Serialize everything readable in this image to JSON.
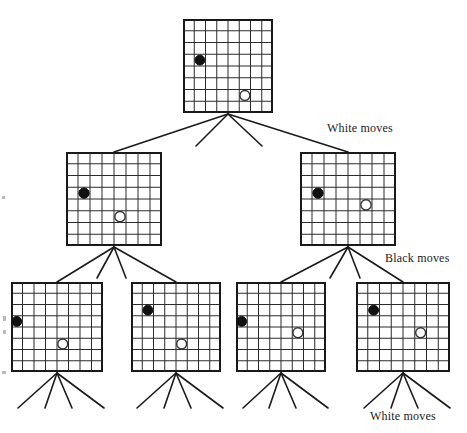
{
  "figure": {
    "type": "game-tree",
    "title": ""
  },
  "labels": [
    {
      "name": "white-moves-level-1",
      "text": "White moves",
      "x": 327,
      "y": 121
    },
    {
      "name": "black-moves-level-2",
      "text": "Black moves",
      "x": 385,
      "y": 251
    },
    {
      "name": "white-moves-level-3",
      "text": "White moves",
      "x": 370,
      "y": 409
    }
  ],
  "board_spec": {
    "cols": 8,
    "rows": 8,
    "grid_color": "#2b2b2b",
    "border_color": "#1a1a1a",
    "grid_line_width": 1,
    "border_line_width": 2,
    "black_stone_color": "#111111",
    "white_stone_fill": "#ffffff",
    "white_stone_stroke": "#333333"
  },
  "levels": [
    {
      "index": 0,
      "name": "root-level",
      "nodes": [
        {
          "id": "root",
          "name": "board-root",
          "x": 183,
          "y": 19,
          "w": 90,
          "h": 94,
          "stones": [
            {
              "color": "black",
              "col": 1,
              "row": 3
            },
            {
              "color": "white",
              "col": 5,
              "row": 6
            }
          ]
        }
      ]
    },
    {
      "index": 1,
      "name": "level-2",
      "nodes": [
        {
          "id": "n-l",
          "name": "board-level2-left",
          "x": 66,
          "y": 152,
          "w": 96,
          "h": 94,
          "stones": [
            {
              "color": "black",
              "col": 1,
              "row": 3
            },
            {
              "color": "white",
              "col": 4,
              "row": 5
            }
          ]
        },
        {
          "id": "n-r",
          "name": "board-level2-right",
          "x": 300,
          "y": 152,
          "w": 96,
          "h": 94,
          "stones": [
            {
              "color": "black",
              "col": 1,
              "row": 3
            },
            {
              "color": "white",
              "col": 5,
              "row": 4
            }
          ]
        }
      ]
    },
    {
      "index": 2,
      "name": "level-3",
      "nodes": [
        {
          "id": "n-ll",
          "name": "board-level3-1",
          "x": 11,
          "y": 282,
          "w": 92,
          "h": 90,
          "stones": [
            {
              "color": "black",
              "col": 0,
              "row": 3
            },
            {
              "color": "white",
              "col": 4,
              "row": 5
            }
          ]
        },
        {
          "id": "n-lr",
          "name": "board-level3-2",
          "x": 131,
          "y": 282,
          "w": 90,
          "h": 90,
          "stones": [
            {
              "color": "black",
              "col": 1,
              "row": 2
            },
            {
              "color": "white",
              "col": 4,
              "row": 5
            }
          ]
        },
        {
          "id": "n-rl",
          "name": "board-level3-3",
          "x": 236,
          "y": 282,
          "w": 90,
          "h": 90,
          "stones": [
            {
              "color": "black",
              "col": 0,
              "row": 3
            },
            {
              "color": "white",
              "col": 5,
              "row": 4
            }
          ]
        },
        {
          "id": "n-rr",
          "name": "board-level3-4",
          "x": 356,
          "y": 282,
          "w": 94,
          "h": 90,
          "stones": [
            {
              "color": "black",
              "col": 1,
              "row": 2
            },
            {
              "color": "white",
              "col": 5,
              "row": 4
            }
          ]
        }
      ]
    }
  ],
  "edges": {
    "line_color": "#1a1a1a",
    "line_width": 1.6,
    "fans": [
      {
        "name": "fan-root",
        "from": {
          "x": 228,
          "y": 114
        },
        "to": [
          {
            "x": 114,
            "y": 152,
            "terminal": true
          },
          {
            "x": 196,
            "y": 152,
            "terminal": false,
            "stub_to": {
              "x": 196,
              "y": 146
            }
          },
          {
            "x": 262,
            "y": 152,
            "terminal": false,
            "stub_to": {
              "x": 262,
              "y": 146
            }
          },
          {
            "x": 348,
            "y": 152,
            "terminal": true
          }
        ]
      },
      {
        "name": "fan-level2-left",
        "from": {
          "x": 114,
          "y": 247
        },
        "to": [
          {
            "x": 57,
            "y": 282,
            "terminal": true
          },
          {
            "x": 97,
            "y": 278,
            "terminal": false
          },
          {
            "x": 126,
            "y": 278,
            "terminal": false
          },
          {
            "x": 176,
            "y": 282,
            "terminal": true
          }
        ]
      },
      {
        "name": "fan-level2-right",
        "from": {
          "x": 348,
          "y": 247
        },
        "to": [
          {
            "x": 281,
            "y": 282,
            "terminal": true
          },
          {
            "x": 330,
            "y": 278,
            "terminal": false
          },
          {
            "x": 360,
            "y": 278,
            "terminal": false
          },
          {
            "x": 403,
            "y": 282,
            "terminal": true
          }
        ]
      },
      {
        "name": "fan-level3-1",
        "from": {
          "x": 57,
          "y": 373
        },
        "to": [
          {
            "x": 18,
            "y": 408,
            "terminal": false
          },
          {
            "x": 45,
            "y": 408,
            "terminal": false
          },
          {
            "x": 72,
            "y": 408,
            "terminal": false
          },
          {
            "x": 104,
            "y": 408,
            "terminal": false
          }
        ]
      },
      {
        "name": "fan-level3-2",
        "from": {
          "x": 176,
          "y": 373
        },
        "to": [
          {
            "x": 137,
            "y": 408,
            "terminal": false
          },
          {
            "x": 164,
            "y": 408,
            "terminal": false
          },
          {
            "x": 191,
            "y": 408,
            "terminal": false
          },
          {
            "x": 223,
            "y": 408,
            "terminal": false
          }
        ]
      },
      {
        "name": "fan-level3-3",
        "from": {
          "x": 281,
          "y": 373
        },
        "to": [
          {
            "x": 243,
            "y": 408,
            "terminal": false
          },
          {
            "x": 269,
            "y": 408,
            "terminal": false
          },
          {
            "x": 296,
            "y": 408,
            "terminal": false
          },
          {
            "x": 328,
            "y": 408,
            "terminal": false
          }
        ]
      },
      {
        "name": "fan-level3-4",
        "from": {
          "x": 403,
          "y": 373
        },
        "to": [
          {
            "x": 364,
            "y": 408,
            "terminal": false
          },
          {
            "x": 391,
            "y": 408,
            "terminal": false
          },
          {
            "x": 418,
            "y": 408,
            "terminal": false
          },
          {
            "x": 450,
            "y": 408,
            "terminal": false
          }
        ]
      }
    ]
  },
  "scan_artifacts": [
    {
      "name": "scan-speck-1",
      "x": 3,
      "y": 316,
      "w": 3,
      "h": 5
    },
    {
      "name": "scan-speck-2",
      "x": 3,
      "y": 330,
      "w": 3,
      "h": 4
    },
    {
      "name": "scan-speck-3",
      "x": 2,
      "y": 371,
      "w": 4,
      "h": 3
    },
    {
      "name": "scan-speck-4",
      "x": 2,
      "y": 196,
      "w": 3,
      "h": 3
    }
  ]
}
